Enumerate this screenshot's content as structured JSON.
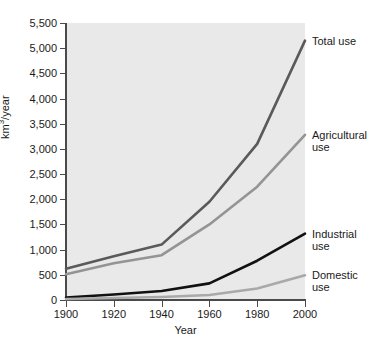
{
  "chart_data": {
    "type": "line",
    "title": "",
    "xlabel": "Year",
    "ylabel": "km3/year",
    "ylabel_base": "km",
    "ylabel_sup": "3",
    "ylabel_tail": "/year",
    "x": [
      1900,
      1920,
      1940,
      1960,
      1980,
      2000
    ],
    "xlim": [
      1900,
      2000
    ],
    "ylim": [
      0,
      5500
    ],
    "grid": false,
    "legend_position": "right-inline-annotations",
    "ytick_labels": [
      "5,500",
      "5,000",
      "4,500",
      "4,000",
      "3,500",
      "3,000",
      "2,500",
      "2,000",
      "1,500",
      "1,000",
      "500",
      "0"
    ],
    "ytick_values": [
      5500,
      5000,
      4500,
      4000,
      3500,
      3000,
      2500,
      2000,
      1500,
      1000,
      500,
      0
    ],
    "xtick_labels": [
      "1900",
      "1920",
      "1940",
      "1960",
      "1980",
      "2000"
    ],
    "series": [
      {
        "name": "Total use",
        "label_text": "Total use",
        "color": "#5a5a5a",
        "values": [
          620,
          870,
          1100,
          1950,
          3100,
          5150
        ]
      },
      {
        "name": "Agricultural use",
        "label_text": "Agricultural\nuse",
        "color": "#949494",
        "values": [
          510,
          730,
          890,
          1500,
          2250,
          3280
        ]
      },
      {
        "name": "Industrial use",
        "label_text": "Industrial\nuse",
        "color": "#111111",
        "values": [
          50,
          110,
          180,
          330,
          780,
          1320
        ]
      },
      {
        "name": "Domestic use",
        "label_text": "Domestic\nuse",
        "color": "#a9a9a9",
        "values": [
          20,
          40,
          60,
          100,
          230,
          490
        ]
      }
    ]
  },
  "style": {
    "plot_background": "#e9e9e9",
    "page_background": "#ffffff",
    "axis_color": "#4a4a4a",
    "text_color": "#1a1a1a"
  }
}
